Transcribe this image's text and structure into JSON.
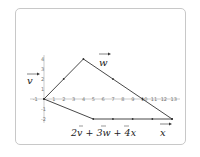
{
  "diagram": {
    "title": "",
    "origin_px": [
      44,
      99
    ],
    "unit_px": [
      9.85,
      10
    ],
    "x_ticks": [
      "-1",
      "1",
      "2",
      "3",
      "4",
      "5",
      "6",
      "7",
      "8",
      "9",
      "10",
      "11",
      "12",
      "13"
    ],
    "y_ticks": [
      "4",
      "3",
      "2",
      "1",
      "-1",
      "-2"
    ],
    "labels": {
      "v": "v",
      "w": "w",
      "x": "x",
      "sum": "2v + 3w + 4x"
    },
    "vectors": {
      "v": [
        2,
        2
      ],
      "w": [
        3,
        -2
      ],
      "x": [
        2,
        0
      ]
    },
    "upper_path_points": [
      [
        0,
        0
      ],
      [
        2,
        2
      ],
      [
        4,
        4
      ],
      [
        7,
        2
      ],
      [
        10,
        0
      ],
      [
        13,
        -2
      ]
    ],
    "lower_path_points": [
      [
        0,
        0
      ],
      [
        5,
        -2
      ],
      [
        7,
        -2
      ],
      [
        9,
        -2
      ],
      [
        11,
        -2
      ],
      [
        13,
        -2
      ]
    ],
    "colors": {
      "line": "#333333",
      "axis": "#aaaaaa",
      "frame": "#c8c8c8"
    }
  }
}
